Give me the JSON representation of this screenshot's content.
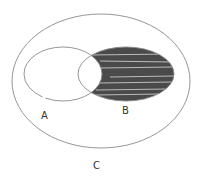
{
  "diagram": {
    "type": "venn",
    "universe": {
      "label": "C"
    },
    "sets": [
      {
        "id": "A",
        "label": "A",
        "shaded": false
      },
      {
        "id": "B",
        "label": "B",
        "shaded_region": "B minus A"
      }
    ],
    "shaded_region": "B \\ A",
    "colors": {
      "outline": "#8a8a8a",
      "shade": "#4a4a4a",
      "stripe": "#d8d8d8",
      "background": "#ffffff"
    }
  }
}
